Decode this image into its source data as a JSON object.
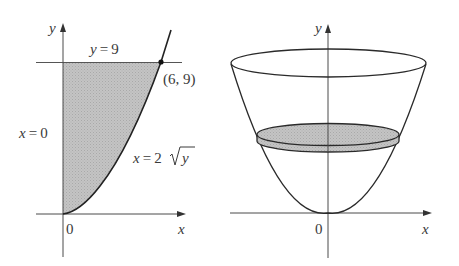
{
  "left_panel": {
    "description": "Region bounded by x = 0, y = 9 and x = 2*sqrt(y), shaded",
    "axis_labels": {
      "x": "x",
      "y": "y"
    },
    "origin_label": "0",
    "line_label_top": "y = 9",
    "line_label_left": "x = 0",
    "curve_label": {
      "lhs": "x = 2",
      "radicand": "y"
    },
    "point_label": "(6, 9)",
    "point": {
      "x": 6,
      "y": 9
    },
    "shade_color": "#bdbdbd"
  },
  "right_panel": {
    "description": "Solid of revolution (paraboloid) about the y-axis with a shaded disk cross-section",
    "axis_labels": {
      "x": "x",
      "y": "y"
    },
    "origin_label": "0",
    "disk_color": "#bdbdbd"
  },
  "colors": {
    "stroke": "#2a2a2a",
    "axis": "#4a4a4a",
    "text": "#3a3a3a",
    "background": "#ffffff"
  }
}
